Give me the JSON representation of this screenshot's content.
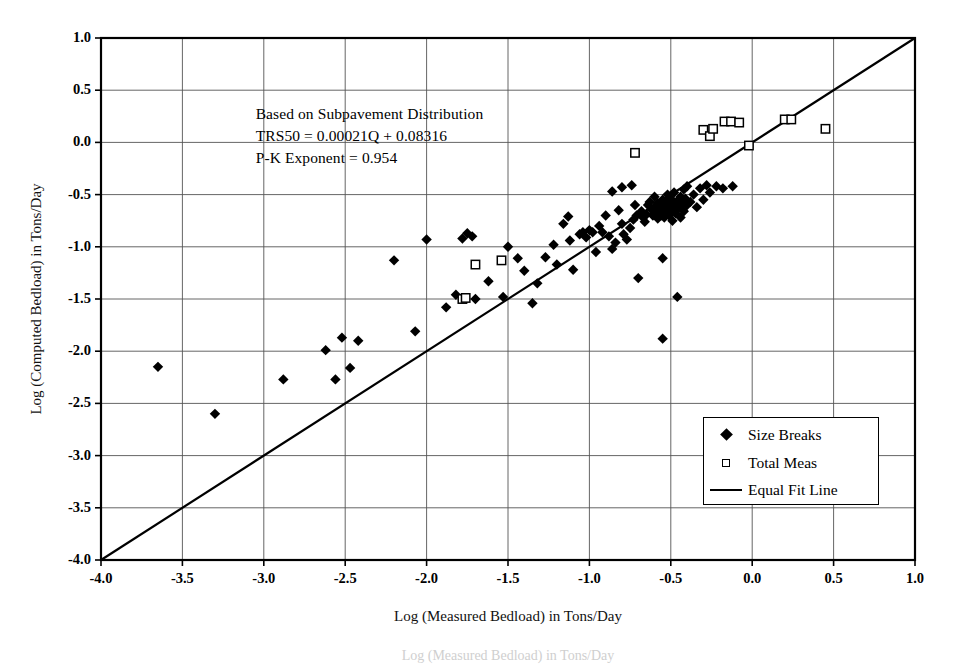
{
  "chart_data": {
    "type": "scatter",
    "title": "",
    "xlabel": "Log (Measured Bedload) in Tons/Day",
    "ylabel": "Log (Computed Bedload) in Tons/Day",
    "xlim": [
      -4.0,
      1.0
    ],
    "ylim": [
      -4.0,
      1.0
    ],
    "xticks": [
      "-4.0",
      "-3.5",
      "-3.0",
      "-2.5",
      "-2.0",
      "-1.5",
      "-1.0",
      "-0.5",
      "0.0",
      "0.5",
      "1.0"
    ],
    "yticks": [
      "1.0",
      "0.5",
      "0.0",
      "-0.5",
      "-1.0",
      "-1.5",
      "-2.0",
      "-2.5",
      "-3.0",
      "-3.5",
      "-4.0"
    ],
    "xtick_values": [
      -4.0,
      -3.5,
      -3.0,
      -2.5,
      -2.0,
      -1.5,
      -1.0,
      -0.5,
      0.0,
      0.5,
      1.0
    ],
    "ytick_values": [
      1.0,
      0.5,
      0.0,
      -0.5,
      -1.0,
      -1.5,
      -2.0,
      -2.5,
      -3.0,
      -3.5,
      -4.0
    ],
    "grid": true,
    "grid_color": "#555555",
    "frame_color": "#000000",
    "background": "#ffffff",
    "legend_position": "lower right",
    "annotation": {
      "lines": [
        "Based on Subpavement Distribution",
        "TRS50 = 0.00021Q + 0.08316",
        "P-K Exponent = 0.954"
      ],
      "x": -3.05,
      "y": 0.36
    },
    "series": [
      {
        "name": "Size Breaks",
        "marker": "filled-diamond",
        "color": "#000000",
        "points": [
          [
            -3.65,
            -2.15
          ],
          [
            -3.3,
            -2.6
          ],
          [
            -2.88,
            -2.27
          ],
          [
            -2.62,
            -1.99
          ],
          [
            -2.56,
            -2.27
          ],
          [
            -2.52,
            -1.87
          ],
          [
            -2.47,
            -2.16
          ],
          [
            -2.42,
            -1.9
          ],
          [
            -2.2,
            -1.13
          ],
          [
            -2.07,
            -1.81
          ],
          [
            -2.0,
            -0.93
          ],
          [
            -1.88,
            -1.58
          ],
          [
            -1.82,
            -1.46
          ],
          [
            -1.78,
            -0.92
          ],
          [
            -1.75,
            -0.87
          ],
          [
            -1.72,
            -0.9
          ],
          [
            -1.7,
            -1.5
          ],
          [
            -1.62,
            -1.33
          ],
          [
            -1.53,
            -1.48
          ],
          [
            -1.5,
            -1.0
          ],
          [
            -1.44,
            -1.11
          ],
          [
            -1.4,
            -1.23
          ],
          [
            -1.35,
            -1.54
          ],
          [
            -1.32,
            -1.35
          ],
          [
            -1.27,
            -1.1
          ],
          [
            -1.22,
            -0.98
          ],
          [
            -1.2,
            -1.17
          ],
          [
            -1.16,
            -0.78
          ],
          [
            -1.12,
            -0.94
          ],
          [
            -1.1,
            -1.22
          ],
          [
            -1.06,
            -0.88
          ],
          [
            -1.04,
            -0.86
          ],
          [
            -1.02,
            -0.91
          ],
          [
            -1.0,
            -0.84
          ],
          [
            -0.98,
            -0.86
          ],
          [
            -0.96,
            -1.05
          ],
          [
            -0.94,
            -0.8
          ],
          [
            -0.92,
            -0.86
          ],
          [
            -0.9,
            -0.7
          ],
          [
            -0.88,
            -0.9
          ],
          [
            -0.86,
            -1.02
          ],
          [
            -0.84,
            -0.96
          ],
          [
            -0.82,
            -0.65
          ],
          [
            -0.8,
            -0.78
          ],
          [
            -0.79,
            -0.88
          ],
          [
            -0.77,
            -0.93
          ],
          [
            -0.75,
            -0.82
          ],
          [
            -0.73,
            -0.74
          ],
          [
            -0.72,
            -0.6
          ],
          [
            -0.71,
            -0.7
          ],
          [
            -0.7,
            -1.3
          ],
          [
            -0.68,
            -0.66
          ],
          [
            -0.67,
            -0.72
          ],
          [
            -0.66,
            -0.76
          ],
          [
            -0.65,
            -0.69
          ],
          [
            -0.64,
            -0.6
          ],
          [
            -0.63,
            -0.57
          ],
          [
            -0.62,
            -0.64
          ],
          [
            -0.61,
            -0.7
          ],
          [
            -0.6,
            -0.62
          ],
          [
            -0.6,
            -0.52
          ],
          [
            -0.59,
            -0.67
          ],
          [
            -0.58,
            -0.73
          ],
          [
            -0.58,
            -0.58
          ],
          [
            -0.57,
            -0.64
          ],
          [
            -0.56,
            -0.6
          ],
          [
            -0.56,
            -0.7
          ],
          [
            -0.55,
            -0.66
          ],
          [
            -0.55,
            -0.55
          ],
          [
            -0.55,
            -1.11
          ],
          [
            -0.55,
            -1.88
          ],
          [
            -0.54,
            -0.62
          ],
          [
            -0.54,
            -0.72
          ],
          [
            -0.53,
            -0.57
          ],
          [
            -0.53,
            -0.67
          ],
          [
            -0.52,
            -0.62
          ],
          [
            -0.52,
            -0.5
          ],
          [
            -0.51,
            -0.7
          ],
          [
            -0.51,
            -0.58
          ],
          [
            -0.5,
            -0.64
          ],
          [
            -0.5,
            -0.54
          ],
          [
            -0.49,
            -0.75
          ],
          [
            -0.48,
            -0.6
          ],
          [
            -0.48,
            -0.48
          ],
          [
            -0.47,
            -0.68
          ],
          [
            -0.46,
            -0.56
          ],
          [
            -0.46,
            -1.48
          ],
          [
            -0.45,
            -0.63
          ],
          [
            -0.44,
            -0.52
          ],
          [
            -0.44,
            -0.72
          ],
          [
            -0.43,
            -0.59
          ],
          [
            -0.42,
            -0.45
          ],
          [
            -0.42,
            -0.66
          ],
          [
            -0.41,
            -0.54
          ],
          [
            -0.4,
            -0.6
          ],
          [
            -0.4,
            -0.42
          ],
          [
            -0.38,
            -0.57
          ],
          [
            -0.36,
            -0.5
          ],
          [
            -0.34,
            -0.62
          ],
          [
            -0.32,
            -0.44
          ],
          [
            -0.3,
            -0.55
          ],
          [
            -0.28,
            -0.41
          ],
          [
            -0.26,
            -0.48
          ],
          [
            -0.22,
            -0.42
          ],
          [
            -0.18,
            -0.44
          ],
          [
            -0.12,
            -0.42
          ],
          [
            -0.74,
            -0.41
          ],
          [
            -0.8,
            -0.43
          ],
          [
            -0.86,
            -0.47
          ],
          [
            -1.13,
            -0.71
          ]
        ]
      },
      {
        "name": "Total Meas",
        "marker": "open-square",
        "color": "#000000",
        "points": [
          [
            -1.78,
            -1.5
          ],
          [
            -1.76,
            -1.49
          ],
          [
            -1.7,
            -1.17
          ],
          [
            -1.54,
            -1.13
          ],
          [
            -0.72,
            -0.1
          ],
          [
            -0.3,
            0.12
          ],
          [
            -0.26,
            0.06
          ],
          [
            -0.24,
            0.13
          ],
          [
            -0.17,
            0.2
          ],
          [
            -0.13,
            0.2
          ],
          [
            -0.08,
            0.19
          ],
          [
            -0.02,
            -0.03
          ],
          [
            0.2,
            0.22
          ],
          [
            0.24,
            0.22
          ],
          [
            0.45,
            0.13
          ]
        ]
      }
    ],
    "reference_line": {
      "name": "Equal Fit Line",
      "from": [
        -4.0,
        -4.0
      ],
      "to": [
        1.0,
        1.0
      ],
      "color": "#000000",
      "width": 2.2
    }
  },
  "legend": {
    "items": [
      {
        "label": "Size Breaks",
        "marker": "filled-diamond"
      },
      {
        "label": "Total Meas",
        "marker": "open-square"
      },
      {
        "label": "Equal Fit Line",
        "marker": "line"
      }
    ]
  },
  "caption": {
    "text": "Log (Measured Bedload) in Tons/Day"
  }
}
